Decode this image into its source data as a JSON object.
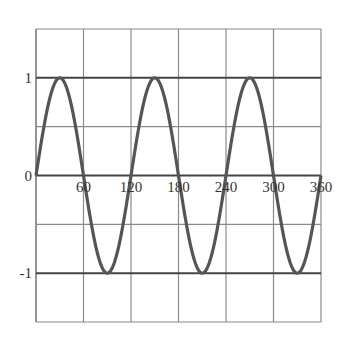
{
  "chart_data": {
    "type": "line",
    "title": "",
    "xlabel": "",
    "ylabel": "",
    "function": "y = sin(3x), x in degrees",
    "xlim": [
      0,
      360
    ],
    "ylim": [
      -1.5,
      1.5
    ],
    "grid": true,
    "legend": null,
    "x_ticks": [
      {
        "value": 60,
        "label": "60"
      },
      {
        "value": 120,
        "label": "120"
      },
      {
        "value": 180,
        "label": "180"
      },
      {
        "value": 240,
        "label": "240"
      },
      {
        "value": 300,
        "label": "300"
      },
      {
        "value": 360,
        "label": "360"
      }
    ],
    "y_ticks": [
      {
        "value": 1,
        "label": "1"
      },
      {
        "value": 0,
        "label": "0"
      },
      {
        "value": -1,
        "label": "-1"
      }
    ],
    "x_gridlines": [
      0,
      60,
      120,
      180,
      240,
      300,
      360
    ],
    "y_gridlines": [
      1.5,
      1,
      0.5,
      0,
      -0.5,
      -1,
      -1.5
    ],
    "emphasized_y_lines": [
      1,
      0,
      -1
    ],
    "series": [
      {
        "name": "sin(3x)",
        "color": "#555555",
        "x": [
          0,
          30,
          60,
          90,
          120,
          150,
          180,
          210,
          240,
          270,
          300,
          330,
          360
        ],
        "values": [
          0,
          1,
          0,
          -1,
          0,
          1,
          0,
          -1,
          0,
          1,
          0,
          -1,
          0
        ]
      }
    ]
  },
  "colors": {
    "grid": "#8a8a8a",
    "emphasis": "#444444",
    "curve": "#555555",
    "text": "#333333"
  }
}
